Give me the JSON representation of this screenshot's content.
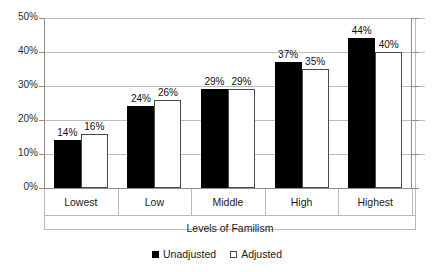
{
  "chart_data": {
    "type": "bar",
    "title": "",
    "xlabel": "Levels of Familism",
    "ylabel": "",
    "categories": [
      "Lowest",
      "Low",
      "Middle",
      "High",
      "Highest"
    ],
    "series": [
      {
        "name": "Unadjusted",
        "color": "#000000",
        "style": "filled",
        "values": [
          14,
          24,
          29,
          37,
          44
        ],
        "labels": [
          "14%",
          "24%",
          "29%",
          "37%",
          "44%"
        ]
      },
      {
        "name": "Adjusted",
        "color": "#ffffff",
        "style": "hollow",
        "values": [
          16,
          26,
          29,
          35,
          40
        ],
        "labels": [
          "16%",
          "26%",
          "29%",
          "35%",
          "40%"
        ]
      }
    ],
    "ylim": [
      0,
      50
    ],
    "ytick_values": [
      0,
      10,
      20,
      30,
      40,
      50
    ],
    "ytick_labels": [
      "0%",
      "10%",
      "20%",
      "30%",
      "40%",
      "50%"
    ],
    "grid": true,
    "legend_position": "bottom"
  },
  "legend": {
    "items": [
      {
        "label": "Unadjusted",
        "swatch": "filled-square-icon"
      },
      {
        "label": "Adjusted",
        "swatch": "hollow-square-icon"
      }
    ]
  }
}
